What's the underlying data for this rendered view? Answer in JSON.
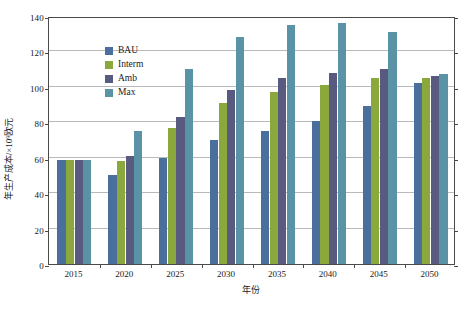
{
  "chart_data": {
    "type": "bar",
    "title": "",
    "xlabel": "年份",
    "ylabel": "年生产成本/×10⁹欧元",
    "ylim": [
      0,
      140
    ],
    "ytick_step": 20,
    "yticks": [
      0,
      20,
      40,
      60,
      80,
      100,
      120,
      140
    ],
    "categories": [
      "2015",
      "2020",
      "2025",
      "2030",
      "2035",
      "2040",
      "2045",
      "2050"
    ],
    "grid": "horizontal",
    "legend_position": "top-left-inside",
    "series": [
      {
        "name": "BAU",
        "color": "#4a6f9c",
        "values": [
          59,
          50,
          60,
          70,
          75,
          81,
          89,
          102
        ]
      },
      {
        "name": "Interm",
        "color": "#8aa83c",
        "values": [
          59,
          58,
          77,
          91,
          97,
          101,
          105,
          105
        ]
      },
      {
        "name": "Amb",
        "color": "#585a7f",
        "values": [
          59,
          61,
          83,
          98,
          105,
          108,
          110,
          106
        ]
      },
      {
        "name": "Max",
        "color": "#5b93a6",
        "values": [
          59,
          75,
          110,
          128,
          135,
          136,
          131,
          107
        ]
      }
    ]
  },
  "legend": {
    "items": [
      {
        "label": "BAU"
      },
      {
        "label": "Interm"
      },
      {
        "label": "Amb"
      },
      {
        "label": "Max"
      }
    ]
  }
}
